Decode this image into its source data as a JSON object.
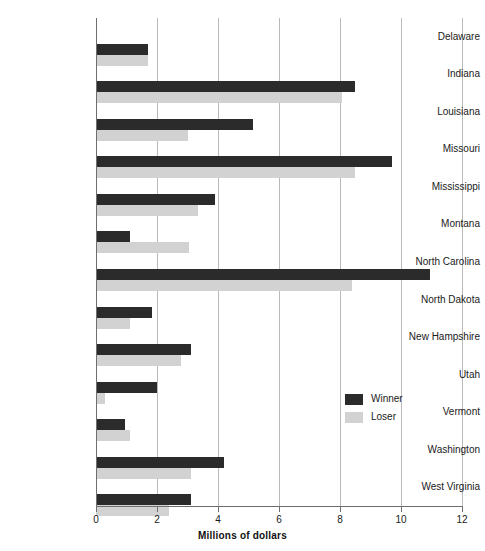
{
  "chart_data": {
    "type": "bar",
    "orientation": "horizontal",
    "title": "",
    "xlabel": "Millions of dollars",
    "ylabel": "",
    "xlim": [
      0,
      12
    ],
    "xticks": [
      0,
      2,
      4,
      6,
      8,
      10,
      12
    ],
    "xtick_labels": [
      "0",
      "2",
      "4",
      "6",
      "8",
      "10",
      "12"
    ],
    "grid": "vertical",
    "legend_position": "center-right",
    "categories": [
      "Delaware",
      "Indiana",
      "Louisiana",
      "Missouri",
      "Mississippi",
      "Montana",
      "North Carolina",
      "North Dakota",
      "New Hampshire",
      "Utah",
      "Vermont",
      "Washington",
      "West Virginia"
    ],
    "series": [
      {
        "name": "Winner",
        "color": "#2b2b2b",
        "values": [
          1.7,
          8.5,
          5.15,
          9.7,
          3.9,
          1.1,
          10.95,
          1.85,
          3.1,
          2.0,
          0.95,
          4.2,
          3.1
        ]
      },
      {
        "name": "Loser",
        "color": "#d2d2d2",
        "values": [
          1.7,
          8.05,
          3.0,
          8.5,
          3.35,
          3.05,
          8.4,
          1.1,
          2.8,
          0.3,
          1.1,
          3.1,
          2.4
        ]
      }
    ]
  },
  "legend": {
    "items": [
      {
        "label": "Winner",
        "color": "#2b2b2b"
      },
      {
        "label": "Loser",
        "color": "#d2d2d2"
      }
    ]
  },
  "axis": {
    "x_title": "Millions of dollars"
  }
}
